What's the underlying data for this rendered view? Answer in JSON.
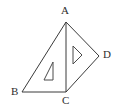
{
  "figure": {
    "background_color": "#ffffff",
    "line_color": "#3a3a3a",
    "label_color": "#2e2e2e",
    "labels": {
      "a": "A",
      "b": "B",
      "c": "C",
      "d": "D"
    },
    "points": {
      "A": {
        "x": 66,
        "y": 22
      },
      "B": {
        "x": 22,
        "y": 92
      },
      "C": {
        "x": 66,
        "y": 92
      },
      "D": {
        "x": 99,
        "y": 56
      }
    },
    "edges": [
      {
        "name": "AB",
        "from": "A",
        "to": "B"
      },
      {
        "name": "BC",
        "from": "B",
        "to": "C"
      },
      {
        "name": "AC",
        "from": "A",
        "to": "C"
      },
      {
        "name": "AD",
        "from": "A",
        "to": "D"
      },
      {
        "name": "CD",
        "from": "C",
        "to": "D"
      }
    ],
    "inner_shapes": [
      {
        "name": "left-inner-triangle",
        "description": "small right triangle inside triangle ABC, vertical right edge",
        "points": "53,62 53,80 44,80"
      },
      {
        "name": "right-inner-triangle",
        "description": "small triangle inside triangle ACD, vertical left edge pointing right",
        "points": "73,46 82,55 73,64"
      }
    ]
  }
}
